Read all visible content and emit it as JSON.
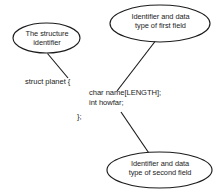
{
  "diagram": {
    "background_color": "#ffffff",
    "stroke_color": "#1c1c1c",
    "text_color": "#1c1c1c",
    "callouts": [
      {
        "id": "structure-identifier",
        "line1": "The structure",
        "line2": "identifier",
        "shape": "ellipse"
      },
      {
        "id": "first-field",
        "line1": "Identifier and data",
        "line2": "type of first field",
        "shape": "ellipse"
      },
      {
        "id": "second-field",
        "line1": "Identifier and data",
        "line2": "type of second field",
        "shape": "ellipse"
      }
    ],
    "code": {
      "open_line": "struct planet {",
      "field_first": "char name[LENGTH];",
      "field_second": "int howfar;",
      "close_line": "};"
    }
  }
}
